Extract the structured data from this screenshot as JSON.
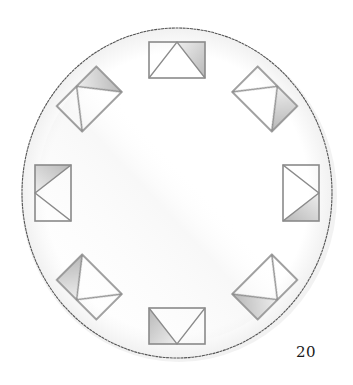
{
  "page": {
    "page_number": "20"
  },
  "illustration": {
    "style": "pencil sketch",
    "circle": {
      "stroke_color": "#555555",
      "fill_color": "#ffffff",
      "shadow_color": "#e6e6e6"
    },
    "tiles": {
      "count": 8,
      "stroke_color": "#8a8a8a",
      "shade_color_dark": "#b8b8b8",
      "shade_color_light": "#eeeeee",
      "items": [
        {
          "position": "top",
          "rotation_deg": 0
        },
        {
          "position": "top-right",
          "rotation_deg": 45
        },
        {
          "position": "right",
          "rotation_deg": 90
        },
        {
          "position": "bottom-right",
          "rotation_deg": 135
        },
        {
          "position": "bottom",
          "rotation_deg": 180
        },
        {
          "position": "bottom-left",
          "rotation_deg": 225
        },
        {
          "position": "left",
          "rotation_deg": 270
        },
        {
          "position": "top-left",
          "rotation_deg": 315
        }
      ]
    }
  }
}
